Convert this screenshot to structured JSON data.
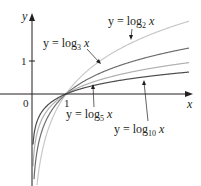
{
  "chart_data": {
    "type": "line",
    "title": "",
    "xlabel": "x",
    "ylabel": "y",
    "xlim": [
      -0.95,
      4.65
    ],
    "ylim": [
      -2.8,
      2.8
    ],
    "grid": false,
    "ticks": {
      "x": [
        {
          "value": 0,
          "label": "0"
        },
        {
          "value": 1,
          "label": "1"
        }
      ],
      "y": [
        {
          "value": 1,
          "label": "1"
        }
      ]
    },
    "series": [
      {
        "name": "y = log2 x",
        "base": 2,
        "color": "#c8c8c8",
        "label_main": "y = log",
        "label_sub": "2",
        "label_var": " x"
      },
      {
        "name": "y = log3 x",
        "base": 3,
        "color": "#6d6e71",
        "label_main": "y = log",
        "label_sub": "3",
        "label_var": " x"
      },
      {
        "name": "y = log5 x",
        "base": 5,
        "color": "#b0b0b0",
        "label_main": "y = log",
        "label_sub": "5",
        "label_var": " x"
      },
      {
        "name": "y = log10 x",
        "base": 10,
        "color": "#4d4d4f",
        "label_main": "y = log",
        "label_sub": "10",
        "label_var": " x"
      }
    ],
    "legend_position": "inline annotations with leader lines"
  },
  "axes": {
    "x_label": "x",
    "y_label": "y",
    "origin_label": "0",
    "x_tick_label": "1",
    "y_tick_label": "1"
  }
}
